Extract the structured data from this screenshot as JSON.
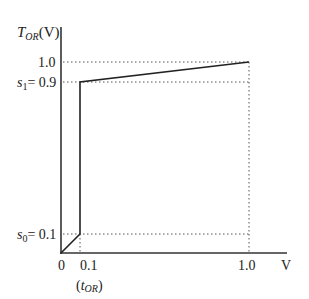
{
  "diagram": {
    "type": "transfer-characteristic",
    "y_axis": {
      "label_main": "T",
      "label_sub": "OR",
      "label_unit": "(V)",
      "ticks": [
        {
          "value": 1.0,
          "label": "1.0",
          "prefix": ""
        },
        {
          "value": 0.9,
          "label": "0.9",
          "prefix": "s",
          "prefix_sub": "1",
          "eq": "= "
        },
        {
          "value": 0.1,
          "label": "0.1",
          "prefix": "s",
          "prefix_sub": "0",
          "eq": "= "
        }
      ]
    },
    "x_axis": {
      "label": "V",
      "ticks": [
        {
          "value": 0,
          "label": "0"
        },
        {
          "value": 0.1,
          "label": "0.1"
        },
        {
          "value": 1.0,
          "label": "1.0"
        }
      ],
      "annotation": {
        "open": "(",
        "main": "t",
        "sub": "OR",
        "close": ")"
      }
    },
    "curve_points": [
      {
        "x": 0,
        "y": 0
      },
      {
        "x": 0.1,
        "y": 0.1
      },
      {
        "x": 0.1,
        "y": 0.9
      },
      {
        "x": 1.0,
        "y": 1.0
      }
    ],
    "colors": {
      "axis": "#333333",
      "curve": "#222222",
      "guide": "#555555"
    }
  }
}
